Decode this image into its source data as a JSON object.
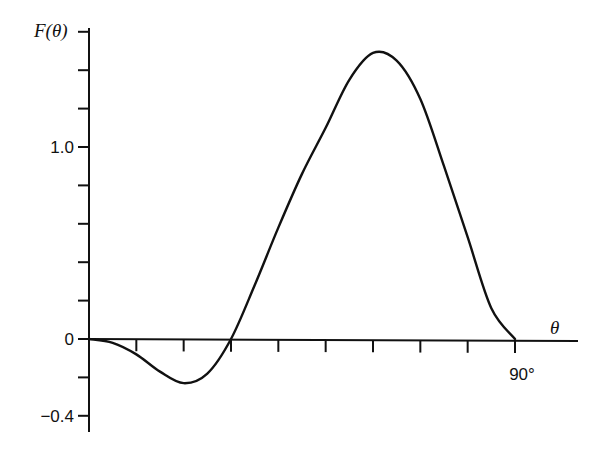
{
  "chart_data": {
    "type": "line",
    "title": "",
    "xlabel": "θ",
    "ylabel": "F(θ)",
    "x_unit": "degrees",
    "xlim": [
      0,
      90
    ],
    "ylim": [
      -0.4,
      1.6
    ],
    "x_ticks": [
      0,
      10,
      20,
      30,
      40,
      50,
      60,
      70,
      80,
      90
    ],
    "x_tick_labels": [
      {
        "value": 90,
        "label": "90°"
      }
    ],
    "y_ticks": [
      -0.4,
      -0.2,
      0,
      0.2,
      0.4,
      0.6,
      0.8,
      1.0,
      1.2,
      1.4,
      1.6
    ],
    "y_tick_labels": [
      {
        "value": 1.0,
        "label": "1.0"
      },
      {
        "value": 0,
        "label": "0"
      },
      {
        "value": -0.4,
        "label": "−0.4"
      }
    ],
    "grid": false,
    "legend": null,
    "series": [
      {
        "name": "F(θ)",
        "x": [
          0,
          5,
          10,
          15,
          20,
          25,
          30,
          35,
          40,
          45,
          50,
          55,
          60,
          65,
          70,
          75,
          80,
          85,
          90
        ],
        "values": [
          0,
          -0.02,
          -0.08,
          -0.17,
          -0.23,
          -0.18,
          0,
          0.28,
          0.58,
          0.86,
          1.1,
          1.35,
          1.49,
          1.45,
          1.25,
          0.9,
          0.53,
          0.16,
          0
        ]
      }
    ]
  },
  "labels": {
    "ylabel": "F(θ)",
    "xlabel": "θ",
    "y_one": "1.0",
    "y_zero": "0",
    "y_neg": "−0.4",
    "x_ninety": "90°"
  }
}
